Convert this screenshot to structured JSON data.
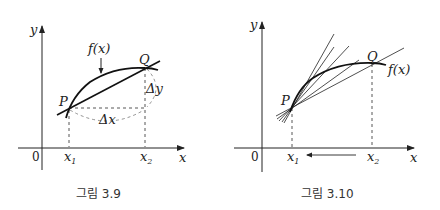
{
  "figures": [
    {
      "id": "fig-3-9",
      "caption": "그림 3.9",
      "labels": {
        "y_axis": "y",
        "x_axis": "x",
        "origin": "0",
        "x1": "x",
        "x1_sub": "1",
        "x2": "x",
        "x2_sub": "2",
        "P": "P",
        "Q": "Q",
        "function": "f(x)",
        "delta_x": "Δx",
        "delta_y": "Δy"
      }
    },
    {
      "id": "fig-3-10",
      "caption": "그림 3.10",
      "labels": {
        "y_axis": "y",
        "x_axis": "x",
        "origin": "0",
        "x1": "x",
        "x1_sub": "1",
        "x2": "x",
        "x2_sub": "2",
        "P": "P",
        "Q": "Q",
        "function": "f(x)"
      }
    }
  ],
  "colors": {
    "ink": "#222222",
    "dashed": "#555555"
  }
}
